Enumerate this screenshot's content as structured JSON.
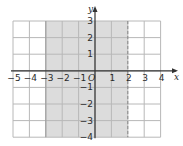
{
  "chart_data": {
    "type": "area",
    "title": "",
    "xlabel": "x",
    "ylabel": "y",
    "origin_label": "O",
    "xlim": [
      -5,
      4
    ],
    "ylim": [
      -4,
      3
    ],
    "grid": true,
    "x_ticks": [
      -5,
      -4,
      -3,
      -2,
      -1,
      1,
      2,
      3,
      4
    ],
    "y_ticks": [
      3,
      2,
      1,
      -1,
      -2,
      -3,
      -4
    ],
    "region": {
      "description": "-3 <= x < 2",
      "x_min": -3,
      "x_max": 2,
      "left_boundary": "solid",
      "right_boundary": "dashed",
      "fill_color": "#dcdcdc"
    },
    "colors": {
      "grid": "#b8b8b8",
      "axis": "#333333",
      "shade": "#dcdcdc",
      "background": "#ffffff"
    }
  }
}
